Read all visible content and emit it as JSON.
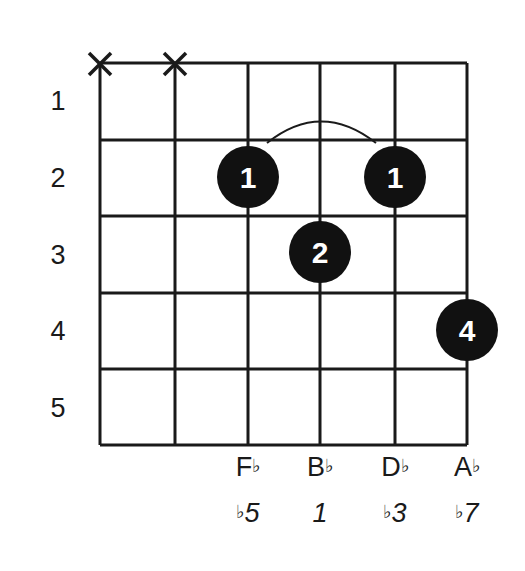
{
  "chord_diagram": {
    "strings": 6,
    "frets_shown": 5,
    "fret_numbers": [
      "1",
      "2",
      "3",
      "4",
      "5"
    ],
    "muted_strings": [
      1,
      2
    ],
    "muted_symbol": "X",
    "finger_dots": [
      {
        "string": 3,
        "fret": 2,
        "finger": "1"
      },
      {
        "string": 5,
        "fret": 2,
        "finger": "1"
      },
      {
        "string": 4,
        "fret": 3,
        "finger": "2"
      },
      {
        "string": 6,
        "fret": 4,
        "finger": "4"
      }
    ],
    "barre_arc": {
      "from_string": 3,
      "to_string": 5,
      "fret": 2
    },
    "note_names": [
      {
        "string": 3,
        "letter": "F",
        "accidental": "♭"
      },
      {
        "string": 4,
        "letter": "B",
        "accidental": "♭"
      },
      {
        "string": 5,
        "letter": "D",
        "accidental": "♭"
      },
      {
        "string": 6,
        "letter": "A",
        "accidental": "♭"
      }
    ],
    "intervals": [
      {
        "string": 3,
        "accidental": "♭",
        "degree": "5"
      },
      {
        "string": 4,
        "accidental": "",
        "degree": "1"
      },
      {
        "string": 5,
        "accidental": "♭",
        "degree": "3"
      },
      {
        "string": 6,
        "accidental": "♭",
        "degree": "7"
      }
    ],
    "colors": {
      "line": "#1a1a1a",
      "dot": "#111111",
      "dot_text": "#ffffff",
      "background": "#ffffff"
    }
  }
}
